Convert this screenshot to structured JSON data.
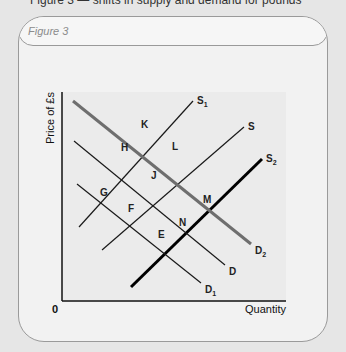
{
  "page": {
    "top_caption": "Figure 3 — shifts in supply and demand for pounds"
  },
  "figure": {
    "title": "Figure 3"
  },
  "chart_data": {
    "type": "line",
    "title": "Figure 3",
    "xlabel": "Quantity",
    "ylabel": "Price of £s",
    "origin_label": "0",
    "grid": false,
    "series": [
      {
        "name": "S1",
        "label": "S",
        "sub": "1",
        "kind": "supply",
        "weight": "thin",
        "points": [
          [
            79,
            227
          ],
          [
            193,
            101
          ]
        ]
      },
      {
        "name": "S",
        "label": "S",
        "sub": "",
        "kind": "supply",
        "weight": "thin",
        "points": [
          [
            102,
            250
          ],
          [
            244,
            127
          ]
        ]
      },
      {
        "name": "S2",
        "label": "S",
        "sub": "2",
        "kind": "supply",
        "weight": "thick",
        "points": [
          [
            131,
            287
          ],
          [
            262,
            159
          ]
        ]
      },
      {
        "name": "D2",
        "label": "D",
        "sub": "2",
        "kind": "demand",
        "weight": "thick-grey",
        "points": [
          [
            73,
            101
          ],
          [
            251,
            244
          ]
        ]
      },
      {
        "name": "D",
        "label": "D",
        "sub": "",
        "kind": "demand",
        "weight": "thin",
        "points": [
          [
            74,
            141
          ],
          [
            225,
            265
          ]
        ]
      },
      {
        "name": "D1",
        "label": "D",
        "sub": "1",
        "kind": "demand",
        "weight": "thin",
        "points": [
          [
            77,
            184
          ],
          [
            201,
            283
          ]
        ]
      }
    ],
    "intersections": [
      {
        "label": "K",
        "x": 144,
        "y": 133
      },
      {
        "label": "H",
        "x": 124,
        "y": 156
      },
      {
        "label": "L",
        "x": 175,
        "y": 155
      },
      {
        "label": "G",
        "x": 103,
        "y": 201
      },
      {
        "label": "J",
        "x": 154,
        "y": 184
      },
      {
        "label": "M",
        "x": 206,
        "y": 208
      },
      {
        "label": "F",
        "x": 131,
        "y": 217
      },
      {
        "label": "N",
        "x": 182,
        "y": 231
      },
      {
        "label": "E",
        "x": 161,
        "y": 243
      }
    ]
  }
}
